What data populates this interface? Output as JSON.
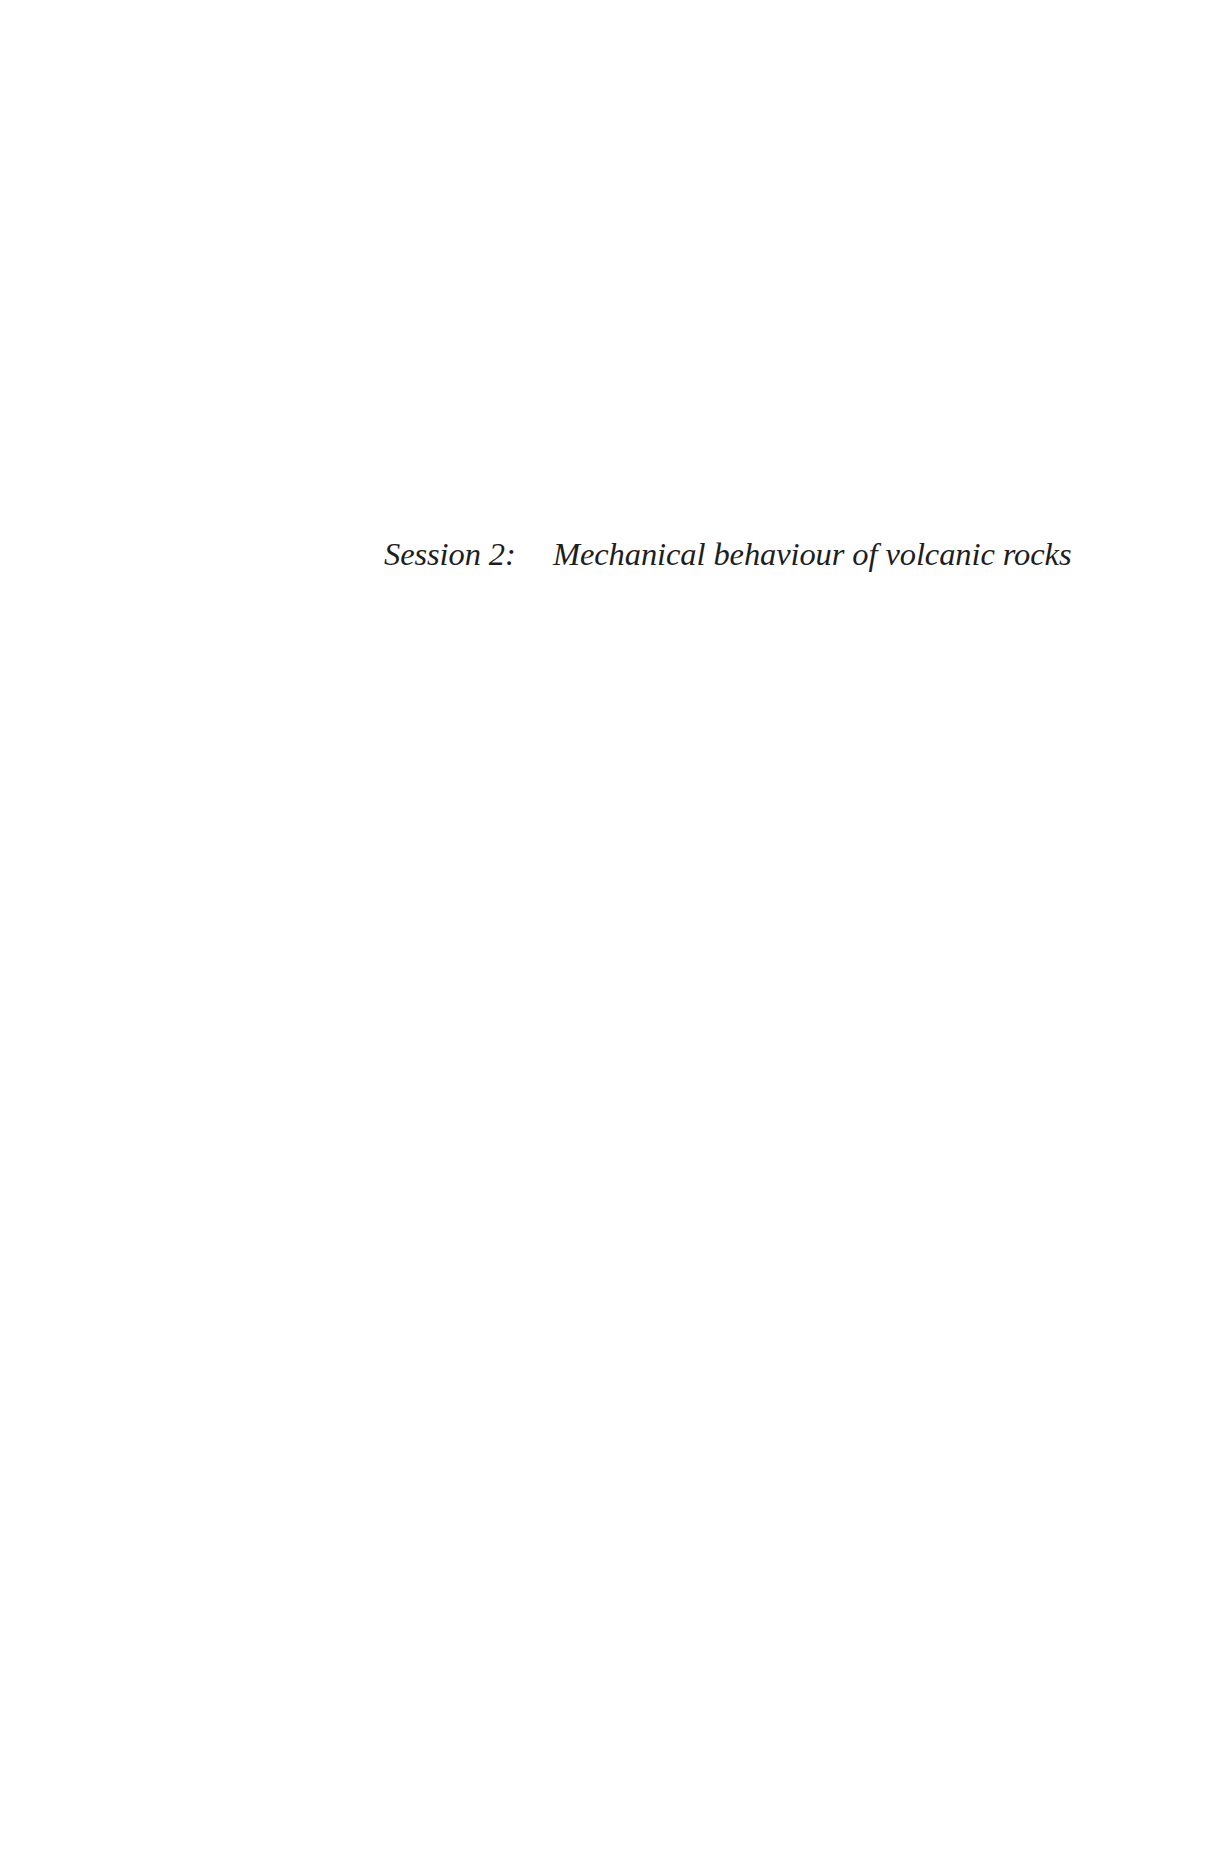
{
  "page": {
    "heading": {
      "session_label": "Session 2:",
      "session_title": "Mechanical behaviour of volcanic rocks"
    }
  }
}
